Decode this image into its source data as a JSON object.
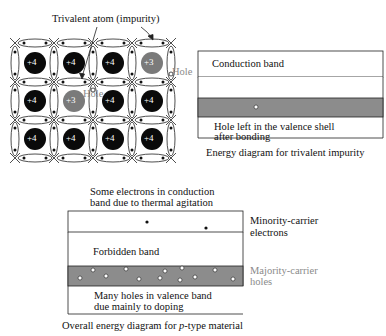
{
  "lattice": {
    "title_label": "Trivalent atom (impurity)",
    "hole_label_1": "Hole",
    "hole_label_2": "Hole",
    "atoms": [
      [
        "+4",
        "+4",
        "+4",
        "+3"
      ],
      [
        "+4",
        "+3",
        "+4",
        "+4"
      ],
      [
        "+4",
        "+4",
        "+4",
        "+4"
      ]
    ],
    "colors": {
      "tetravalent": "#0a0a0a",
      "trivalent": "#7a7a7a",
      "bond": "#222222"
    }
  },
  "trivalent_energy": {
    "conduction_label": "Conduction band",
    "hole_label_line1": "Hole left in the valence shell",
    "hole_label_line2": "after bonding",
    "caption": "Energy diagram for trivalent impurity",
    "band_fill": "#8c8c8c"
  },
  "ptype_energy": {
    "top_note_line1": "Some electrons in conduction",
    "top_note_line2": "band due to thermal agitation",
    "minority_line1": "Minority-carrier",
    "minority_line2": "electrons",
    "forbidden_label": "Forbidden band",
    "majority_line1": "Majority-carrier",
    "majority_line2": "holes",
    "valence_note_line1": "Many holes in valence band",
    "valence_note_line2": "due mainly to doping",
    "caption_prefix": "Overall energy diagram for ",
    "caption_italic": "p",
    "caption_suffix": "-type material",
    "band_fill": "#8c8c8c"
  }
}
